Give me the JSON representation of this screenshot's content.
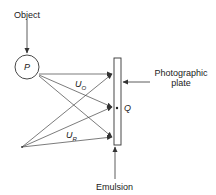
{
  "labels": {
    "object": "Object",
    "p": "P",
    "uo_main": "U",
    "uo_sub": "O",
    "ur_main": "U",
    "ur_sub": "R",
    "q": "Q",
    "plate_line1": "Photographic",
    "plate_line2": "plate",
    "emulsion": "Emulsion"
  },
  "colors": {
    "stroke": "#333333",
    "text": "#222222",
    "background": "#ffffff"
  }
}
